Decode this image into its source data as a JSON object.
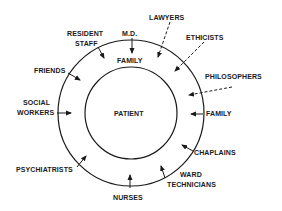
{
  "diagram": {
    "center_label": "PATIENT",
    "inner_ring_label": "FAMILY",
    "colors": {
      "line": "#1a1a1a",
      "background": "#ffffff"
    },
    "outer_influences_solid": [
      {
        "id": "resident-staff",
        "lines": [
          "RESIDENT",
          "STAFF"
        ]
      },
      {
        "id": "md",
        "lines": [
          "M.D."
        ]
      },
      {
        "id": "friends",
        "lines": [
          "FRIENDS"
        ]
      },
      {
        "id": "social-workers",
        "lines": [
          "SOCIAL",
          "WORKERS"
        ]
      },
      {
        "id": "psychiatrists",
        "lines": [
          "PSYCHIATRISTS"
        ]
      },
      {
        "id": "nurses",
        "lines": [
          "NURSES"
        ]
      },
      {
        "id": "ward-technicians",
        "lines": [
          "WARD",
          "TECHNICIANS"
        ]
      },
      {
        "id": "chaplains",
        "lines": [
          "CHAPLAINS"
        ]
      },
      {
        "id": "family-outer",
        "lines": [
          "FAMILY"
        ]
      }
    ],
    "outer_influences_dashed": [
      {
        "id": "lawyers",
        "lines": [
          "LAWYERS"
        ]
      },
      {
        "id": "ethicists",
        "lines": [
          "ETHICISTS"
        ]
      },
      {
        "id": "philosophers",
        "lines": [
          "PHILOSOPHERS"
        ]
      }
    ]
  },
  "labels": {
    "resident": "RESIDENT",
    "staff": "STAFF",
    "md": "M.D.",
    "lawyers": "LAWYERS",
    "ethicists": "ETHICISTS",
    "philosophers": "PHILOSOPHERS",
    "friends": "FRIENDS",
    "social": "SOCIAL",
    "workers": "WORKERS",
    "family_inner": "FAMILY",
    "patient": "PATIENT",
    "family_outer": "FAMILY",
    "chaplains": "CHAPLAINS",
    "psychiatrists": "PSYCHIATRISTS",
    "ward": "WARD",
    "technicians": "TECHNICIANS",
    "nurses": "NURSES"
  }
}
